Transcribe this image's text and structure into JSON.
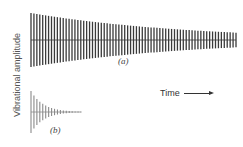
{
  "figure": {
    "y_axis_label": "Vibrational amplitude",
    "x_axis_label": "Time",
    "panels": [
      {
        "id": "a",
        "label": "(a)",
        "description": "Slowly decaying oscillation",
        "x_start": 31,
        "x_end": 236,
        "center_y": 40,
        "initial_half_amplitude": 27,
        "decay_rate": 1.3,
        "cycles": 70,
        "color": "#3a3a3a"
      },
      {
        "id": "b",
        "label": "(b)",
        "description": "Rapidly decaying oscillation",
        "x_start": 31,
        "x_end": 81,
        "center_y": 112,
        "initial_half_amplitude": 21,
        "decay_rate": 4.0,
        "cycles": 17,
        "color": "#8a8a8a"
      }
    ]
  },
  "chart_data": {
    "type": "line",
    "title": "",
    "xlabel": "Time",
    "ylabel": "Vibrational amplitude",
    "series": [
      {
        "name": "(a)",
        "shape": "damped oscillation, slow decay",
        "relative_duration": 1.0,
        "relative_initial_amplitude": 1.0
      },
      {
        "name": "(b)",
        "shape": "damped oscillation, fast decay",
        "relative_duration": 0.25,
        "relative_initial_amplitude": 0.78
      }
    ],
    "grid": false,
    "legend": "none"
  }
}
